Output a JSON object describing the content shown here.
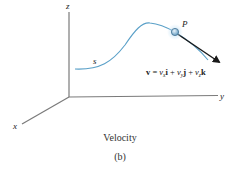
{
  "figure": {
    "axes": {
      "z_label": "z",
      "y_label": "y",
      "x_label": "x"
    },
    "curve": {
      "path_label": "s",
      "point_label": "P",
      "color": "#5aa0c8"
    },
    "vector_equation": {
      "lhs": "v",
      "eq": " = ",
      "t1_coef": "v",
      "t1_sub": "x",
      "t1_unit": "i",
      "plus1": " + ",
      "t2_coef": "v",
      "t2_sub": "y",
      "t2_unit": "j",
      "plus2": " + ",
      "t3_coef": "v",
      "t3_sub": "z",
      "t3_unit": "k"
    },
    "caption": {
      "title": "Velocity",
      "subfigure": "(b)"
    },
    "colors": {
      "axis": "#7a7a7a",
      "curve": "#5aa0c8",
      "arrow": "#1a1a1a",
      "point_fill": "#9cc4de"
    }
  }
}
